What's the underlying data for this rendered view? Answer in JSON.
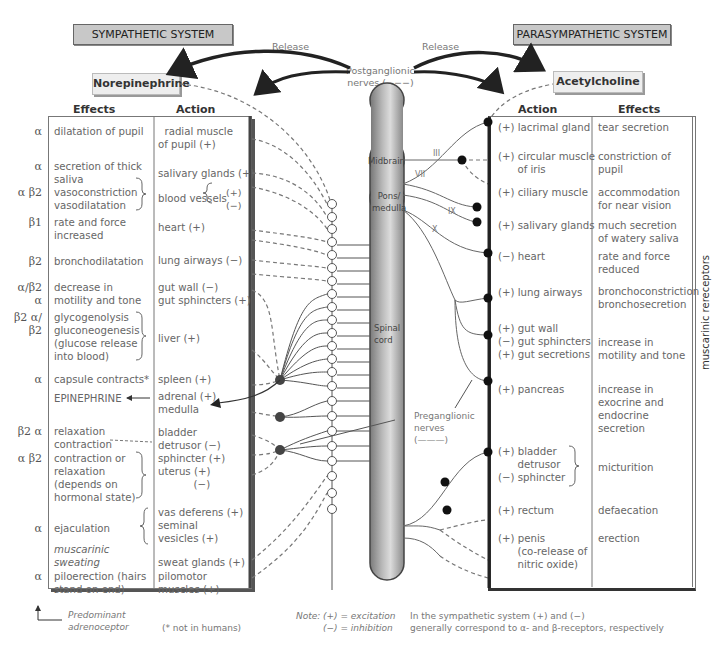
{
  "sympathetic": {
    "title": "SYMPATHETIC SYSTEM",
    "neurotransmitter": "Norepinephrine",
    "release_label": "Release",
    "col_effects": "Effects",
    "col_action": "Action",
    "rows": [
      {
        "receptor": "α",
        "effect": "dilatation of pupil",
        "action": "  radial muscle\nof pupil (+)"
      },
      {
        "receptor": "α",
        "effect": "secretion of thick\nsaliva",
        "action": "salivary glands (+)"
      },
      {
        "receptor": "α\nβ2",
        "effect": "vasoconstriction\nvasodilatation",
        "action": "blood vessels",
        "action_signs": "(+)\n(−)"
      },
      {
        "receptor": "β1",
        "effect": "rate and force\nincreased",
        "action": "heart (+)"
      },
      {
        "receptor": "β2",
        "effect": "bronchodilatation",
        "action": "lung airways (−)"
      },
      {
        "receptor": "α/β2\nα",
        "effect": "decrease in\nmotility and tone",
        "action": "gut wall (−)\ngut sphincters (+)"
      },
      {
        "receptor": "β2\nα/β2",
        "effect": "glycogenolysis\ngluconeogenesis\n(glucose release\ninto blood)",
        "action": "liver (+)"
      },
      {
        "receptor": "α",
        "effect": "capsule contracts*",
        "action": "spleen (+)"
      },
      {
        "receptor": "",
        "effect": "EPINEPHRINE",
        "action": "adrenal (+)\nmedulla"
      },
      {
        "receptor": "β2\nα",
        "effect": "relaxation\ncontraction",
        "action": "bladder\ndetrusor (−)"
      },
      {
        "receptor": "α\nβ2",
        "effect": "contraction or\nrelaxation\n(depends on\nhormonal state)",
        "action": "sphincter (+)\nuterus (+)\n           (−)"
      },
      {
        "receptor": "α",
        "effect": "ejaculation",
        "action": "vas deferens (+)\nseminal\nvesicles (+)"
      },
      {
        "receptor": "",
        "effect": "muscarinic\nsweating",
        "action": "sweat glands (+)"
      },
      {
        "receptor": "α",
        "effect": "piloerection (hairs\nstand on end)",
        "action": "pilomotor\nmuscles (+)"
      }
    ],
    "footnote_receptor": "Predominant\nadrenoceptor",
    "footnote_star": "(* not in humans)"
  },
  "parasympathetic": {
    "title": "PARASYMPATHETIC SYSTEM",
    "neurotransmitter": "Acetylcholine",
    "release_label": "Release",
    "col_action": "Action",
    "col_effects": "Effects",
    "side_label": "muscarinic rereceptors",
    "rows": [
      {
        "action": "(+) lacrimal gland",
        "effect": "tear secretion"
      },
      {
        "action": "(+) circular muscle\n      of iris",
        "effect": "constriction of\npupil"
      },
      {
        "action": "(+) ciliary muscle",
        "effect": "accommodation\nfor near vision"
      },
      {
        "action": "(+) salivary glands",
        "effect": "much secretion\nof watery saliva"
      },
      {
        "action": "(−) heart",
        "effect": "rate and force\nreduced"
      },
      {
        "action": "(+) lung airways",
        "effect": "bronchoconstriction\nbronchosecretion"
      },
      {
        "action": "(+) gut wall\n(−) gut sphincters\n(+) gut secretions",
        "effect": "\nincrease in\nmotility and tone"
      },
      {
        "action": "(+) pancreas",
        "effect": "increase in\nexocrine and\nendocrine\nsecretion"
      },
      {
        "action": "(+) bladder\n      detrusor\n(−) sphincter",
        "effect": "\nmicturition"
      },
      {
        "action": "(+) rectum",
        "effect": "defaecation"
      },
      {
        "action": "(+) penis\n      (co-release of\n      nitric oxide)",
        "effect": "erection"
      }
    ]
  },
  "cns": {
    "midbrain": "Midbrain",
    "pons": "Pons/\nmedulla",
    "spinal_cord": "Spinal\ncord",
    "nerves": [
      "III",
      "VII",
      "IX",
      "X"
    ]
  },
  "labels": {
    "postganglionic": "Postganglionic\nnerves (−−−)",
    "preganglionic": "Preganglionic\nnerves\n(———)"
  },
  "notes": {
    "note_label": "Note:",
    "excitation": "(+) = excitation",
    "inhibition": "(−) = inhibition",
    "general": "In the sympathetic system (+) and (−)\ngenerally correspond to α- and β-receptors, respectively"
  },
  "colors": {
    "title_bg": "#c8c8c8",
    "cord_dark": "#777777",
    "cord_light": "#d8d8d8",
    "ink": "#555555"
  }
}
